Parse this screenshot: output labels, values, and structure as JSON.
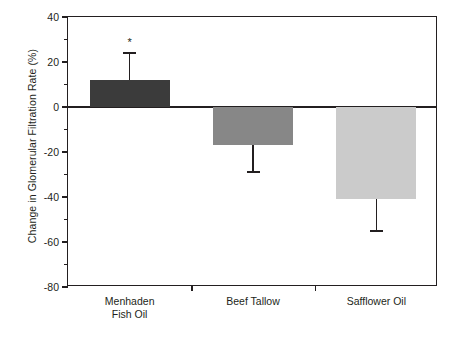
{
  "chart_data": {
    "type": "bar",
    "title": "",
    "xlabel": "",
    "ylabel": "Change in Glomerular Filtration Rate (%)",
    "categories": [
      "Menhaden\nFish Oil",
      "Beef Tallow",
      "Safflower Oil"
    ],
    "values": [
      12,
      -17,
      -41
    ],
    "errors_upper": [
      12,
      0,
      0
    ],
    "errors_lower": [
      0,
      12,
      14
    ],
    "error_top_values": [
      24,
      -17,
      -41
    ],
    "error_bottom_values": [
      12,
      -29,
      -55
    ],
    "bar_colors": [
      "#3b3b3b",
      "#878787",
      "#cbcbcb"
    ],
    "annotations": [
      {
        "category_index": 0,
        "text": "*",
        "value": 30
      }
    ],
    "ylim": [
      -80,
      40
    ],
    "ytick_labels": [
      "40",
      "20",
      "0",
      "-20",
      "-40",
      "-60",
      "-80"
    ],
    "ytick_values": [
      40,
      20,
      0,
      -20,
      -40,
      -60,
      -80
    ],
    "yminor_values": [
      30,
      10,
      -10,
      -30,
      -50,
      -70
    ],
    "grid": false,
    "legend": "none",
    "axis_color": "#231f20"
  }
}
